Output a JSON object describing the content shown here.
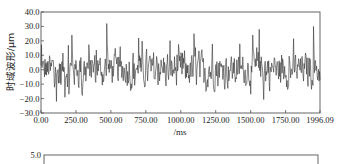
{
  "chart_data": [
    {
      "type": "line",
      "title": "",
      "xlabel": "/ms",
      "ylabel": "时域波形/μm",
      "xlim": [
        0,
        1996.09
      ],
      "ylim": [
        -30.0,
        40.0
      ],
      "grid": false,
      "legend": null,
      "x_ticks": [
        "0.00",
        "250.00",
        "500.00",
        "750.00",
        "1000.00",
        "1250.00",
        "1500.00",
        "1750.00",
        "1996.09"
      ],
      "y_ticks": [
        "40.0",
        "30.0",
        "20.0",
        "10.0",
        "0.0",
        "-10.0",
        "-20.0",
        "-30.0"
      ],
      "series": [
        {
          "name": "时域波形",
          "description": "dense noisy vibration waveform oscillating around 0 mostly between -15 and +12 with periodic spikes",
          "peaks": [
            {
              "x": 220,
              "y": 24
            },
            {
              "x": 470,
              "y": 32
            },
            {
              "x": 700,
              "y": 22
            },
            {
              "x": 1095,
              "y": 25
            },
            {
              "x": 1560,
              "y": 28
            },
            {
              "x": 1950,
              "y": 30
            }
          ],
          "troughs": [
            {
              "x": 110,
              "y": -22
            },
            {
              "x": 200,
              "y": -17
            },
            {
              "x": 650,
              "y": -13
            },
            {
              "x": 1180,
              "y": -15
            },
            {
              "x": 1500,
              "y": -17
            }
          ]
        }
      ]
    },
    {
      "type": "line",
      "title": "",
      "partial": true,
      "y_ticks": [
        "5.0"
      ],
      "series": []
    }
  ],
  "top_chart": {
    "ylabel": "时域波形/μm",
    "xlabel": "/ms",
    "y_ticks": [
      "40.0",
      "30.0",
      "20.0",
      "10.0",
      "0.0",
      "-10.0",
      "-20.0",
      "-30.0"
    ],
    "x_ticks": [
      "0.00",
      "250.00",
      "500.00",
      "750.00",
      "1000.00",
      "1250.00",
      "1500.00",
      "1750.00",
      "1996.09"
    ]
  },
  "bottom_chart": {
    "y_top_tick": "5.0"
  }
}
